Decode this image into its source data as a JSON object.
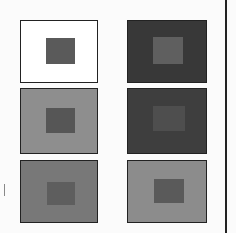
{
  "figure": {
    "panels": [
      {
        "id": "top-left",
        "background": "#ffffff",
        "square": "#5a5a5a",
        "x": 20,
        "y": 20,
        "w": 78,
        "h": 63,
        "sq": {
          "x": 25,
          "y": 17,
          "w": 29,
          "h": 26
        }
      },
      {
        "id": "middle-left",
        "background": "#8e8e8e",
        "square": "#565656",
        "x": 20,
        "y": 88,
        "w": 78,
        "h": 66,
        "sq": {
          "x": 25,
          "y": 19,
          "w": 29,
          "h": 25
        }
      },
      {
        "id": "bottom-left",
        "background": "#787878",
        "square": "#5e5e5e",
        "x": 20,
        "y": 160,
        "w": 78,
        "h": 63,
        "sq": {
          "x": 26,
          "y": 21,
          "w": 28,
          "h": 23
        }
      },
      {
        "id": "top-right",
        "background": "#383838",
        "square": "#5f5f5f",
        "x": 127,
        "y": 20,
        "w": 80,
        "h": 63,
        "sq": {
          "x": 25,
          "y": 16,
          "w": 30,
          "h": 27
        }
      },
      {
        "id": "middle-right",
        "background": "#3e3e3e",
        "square": "#4e4e4e",
        "x": 127,
        "y": 88,
        "w": 80,
        "h": 66,
        "sq": {
          "x": 25,
          "y": 17,
          "w": 32,
          "h": 25
        }
      },
      {
        "id": "bottom-right",
        "background": "#8c8c8c",
        "square": "#5a5a5a",
        "x": 127,
        "y": 160,
        "w": 80,
        "h": 63,
        "sq": {
          "x": 26,
          "y": 18,
          "w": 30,
          "h": 24
        }
      }
    ],
    "divider_color": "#222222"
  }
}
